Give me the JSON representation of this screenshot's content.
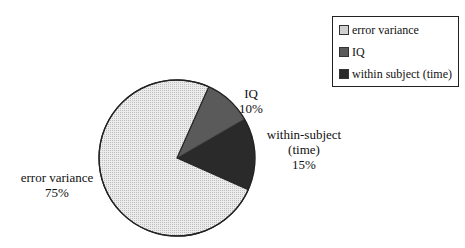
{
  "chart_data": {
    "type": "pie",
    "title": "",
    "categories": [
      "error variance",
      "IQ",
      "within subject (time)"
    ],
    "values": [
      75,
      10,
      15
    ],
    "slice_labels": [
      {
        "name": "error variance",
        "pct": "75%"
      },
      {
        "name": "IQ",
        "pct": "10%"
      },
      {
        "name_lines": [
          "within-subject",
          "(time)"
        ],
        "pct": "15%"
      }
    ],
    "colors": [
      "#e2e2e2",
      "#5a5a5a",
      "#2a2a2a"
    ],
    "legend_position": "top-right"
  },
  "legend": {
    "items": [
      {
        "label": "error variance",
        "color": "#d8d8d8"
      },
      {
        "label": "IQ",
        "color": "#5a5a5a"
      },
      {
        "label": "within subject (time)",
        "color": "#2a2a2a"
      }
    ]
  },
  "labels": {
    "error": {
      "name": "error variance",
      "pct": "75%"
    },
    "iq": {
      "name": "IQ",
      "pct": "10%"
    },
    "within": {
      "line1": "within-subject",
      "line2": "(time)",
      "pct": "15%"
    }
  }
}
